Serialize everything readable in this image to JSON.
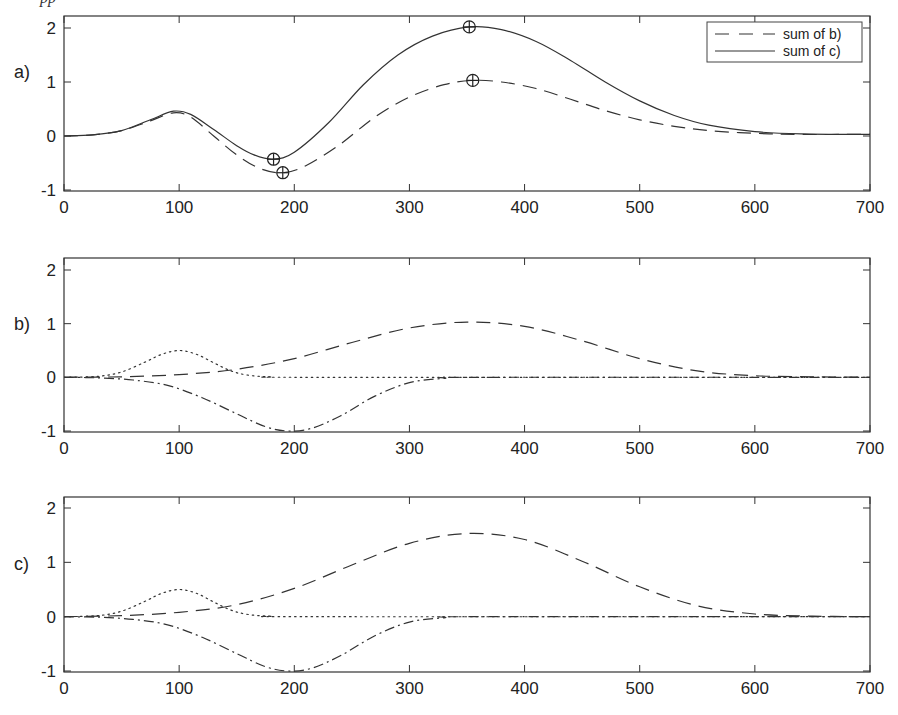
{
  "caption_fragment": "pp",
  "chart_data": [
    {
      "type": "line",
      "panel_label": "a)",
      "title": "",
      "xlabel": "",
      "ylabel": "",
      "xlim": [
        0,
        700
      ],
      "ylim": [
        -1,
        2.2
      ],
      "xticks": [
        0,
        100,
        200,
        300,
        400,
        500,
        600,
        700
      ],
      "yticks": [
        -1,
        0,
        1,
        2
      ],
      "grid": false,
      "legend_position": "upper right",
      "legend": [
        {
          "label": "sum of b)",
          "style": "dashed"
        },
        {
          "label": "sum of c)",
          "style": "solid"
        }
      ],
      "series": [
        {
          "name": "sum of b)",
          "style": "dashed",
          "x": [
            0,
            25,
            50,
            75,
            95,
            110,
            130,
            150,
            170,
            190,
            210,
            240,
            270,
            300,
            330,
            355,
            380,
            410,
            440,
            470,
            500,
            530,
            560,
            600,
            640,
            700
          ],
          "y": [
            0,
            0.02,
            0.1,
            0.28,
            0.43,
            0.35,
            0.0,
            -0.35,
            -0.6,
            -0.68,
            -0.55,
            -0.15,
            0.35,
            0.72,
            0.95,
            1.03,
            1.0,
            0.88,
            0.68,
            0.47,
            0.3,
            0.18,
            0.1,
            0.05,
            0.03,
            0.03
          ]
        },
        {
          "name": "sum of c)",
          "style": "solid",
          "x": [
            0,
            25,
            50,
            75,
            95,
            110,
            130,
            150,
            165,
            182,
            200,
            230,
            260,
            290,
            320,
            352,
            380,
            410,
            440,
            470,
            500,
            530,
            560,
            600,
            640,
            700
          ],
          "y": [
            0,
            0.02,
            0.1,
            0.3,
            0.46,
            0.4,
            0.12,
            -0.18,
            -0.35,
            -0.43,
            -0.3,
            0.25,
            0.95,
            1.5,
            1.85,
            2.02,
            1.97,
            1.75,
            1.4,
            1.0,
            0.65,
            0.38,
            0.2,
            0.08,
            0.04,
            0.03
          ]
        }
      ],
      "markers": [
        {
          "x": 182,
          "y": -0.43,
          "symbol": "circle-plus"
        },
        {
          "x": 190,
          "y": -0.68,
          "symbol": "circle-plus"
        },
        {
          "x": 352,
          "y": 2.02,
          "symbol": "circle-plus"
        },
        {
          "x": 355,
          "y": 1.03,
          "symbol": "circle-plus"
        }
      ]
    },
    {
      "type": "line",
      "panel_label": "b)",
      "title": "",
      "xlabel": "",
      "ylabel": "",
      "xlim": [
        0,
        700
      ],
      "ylim": [
        -1,
        2.2
      ],
      "xticks": [
        0,
        100,
        200,
        300,
        400,
        500,
        600,
        700
      ],
      "yticks": [
        -1,
        0,
        1,
        2
      ],
      "grid": false,
      "series": [
        {
          "name": "component 1",
          "style": "dotted",
          "x": [
            0,
            30,
            50,
            70,
            85,
            100,
            115,
            130,
            145,
            160,
            180,
            220,
            700
          ],
          "y": [
            0,
            0.02,
            0.1,
            0.28,
            0.43,
            0.5,
            0.43,
            0.27,
            0.12,
            0.04,
            0.01,
            0,
            0
          ]
        },
        {
          "name": "component 2",
          "style": "dashed",
          "x": [
            0,
            50,
            100,
            150,
            200,
            250,
            300,
            350,
            400,
            450,
            500,
            550,
            600,
            650,
            700
          ],
          "y": [
            0,
            0.01,
            0.05,
            0.15,
            0.35,
            0.65,
            0.92,
            1.03,
            0.95,
            0.68,
            0.35,
            0.12,
            0.03,
            0.01,
            0
          ]
        },
        {
          "name": "component 3",
          "style": "dashdot",
          "x": [
            0,
            30,
            60,
            90,
            120,
            150,
            175,
            195,
            215,
            240,
            270,
            300,
            330,
            360,
            700
          ],
          "y": [
            0,
            -0.01,
            -0.05,
            -0.15,
            -0.38,
            -0.68,
            -0.92,
            -1.0,
            -0.95,
            -0.72,
            -0.35,
            -0.1,
            -0.02,
            0,
            0
          ]
        }
      ]
    },
    {
      "type": "line",
      "panel_label": "c)",
      "title": "",
      "xlabel": "",
      "ylabel": "",
      "xlim": [
        0,
        700
      ],
      "ylim": [
        -1,
        2.2
      ],
      "xticks": [
        0,
        100,
        200,
        300,
        400,
        500,
        600,
        700
      ],
      "yticks": [
        -1,
        0,
        1,
        2
      ],
      "grid": false,
      "series": [
        {
          "name": "component 1",
          "style": "dotted",
          "x": [
            0,
            30,
            50,
            70,
            85,
            100,
            115,
            130,
            145,
            160,
            180,
            220,
            700
          ],
          "y": [
            0,
            0.02,
            0.1,
            0.28,
            0.43,
            0.5,
            0.43,
            0.27,
            0.12,
            0.04,
            0.01,
            0,
            0
          ]
        },
        {
          "name": "component 2",
          "style": "dashed",
          "x": [
            0,
            50,
            100,
            150,
            200,
            250,
            300,
            350,
            400,
            450,
            500,
            550,
            600,
            650,
            700
          ],
          "y": [
            0,
            0.02,
            0.08,
            0.22,
            0.52,
            0.95,
            1.35,
            1.53,
            1.42,
            1.02,
            0.55,
            0.2,
            0.05,
            0.01,
            0
          ]
        },
        {
          "name": "component 3",
          "style": "dashdot",
          "x": [
            0,
            30,
            60,
            90,
            120,
            150,
            175,
            195,
            215,
            240,
            270,
            300,
            330,
            360,
            700
          ],
          "y": [
            0,
            -0.01,
            -0.05,
            -0.15,
            -0.38,
            -0.68,
            -0.92,
            -1.0,
            -0.95,
            -0.72,
            -0.35,
            -0.1,
            -0.02,
            0,
            0
          ]
        }
      ]
    }
  ],
  "layout": {
    "plot_left": 64,
    "plot_right": 870,
    "panels": [
      {
        "top": 16,
        "bottom": 191,
        "y_at_2": 28,
        "y_at_m1": 190,
        "label_x": 14,
        "label_y": 78
      },
      {
        "top": 258,
        "bottom": 432,
        "y_at_2": 270,
        "y_at_m1": 431,
        "label_x": 14,
        "label_y": 330
      },
      {
        "top": 497,
        "bottom": 672,
        "y_at_2": 508,
        "y_at_m1": 671,
        "label_x": 14,
        "label_y": 570
      }
    ],
    "dash_styles": {
      "solid": "",
      "dashed": "14,8",
      "dotted": "1.5,4",
      "dashdot": "10,4,2,4"
    }
  }
}
